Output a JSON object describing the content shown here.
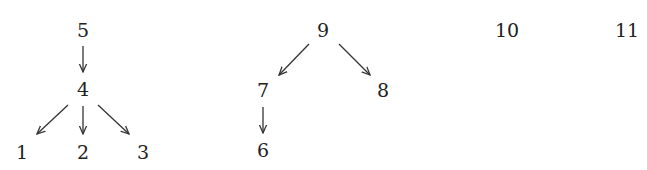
{
  "diagram": {
    "type": "forest",
    "nodes": [
      {
        "id": "5",
        "label": "5",
        "x": 83,
        "y": 30
      },
      {
        "id": "4",
        "label": "4",
        "x": 83,
        "y": 89
      },
      {
        "id": "1",
        "label": "1",
        "x": 22,
        "y": 152
      },
      {
        "id": "2",
        "label": "2",
        "x": 83,
        "y": 152
      },
      {
        "id": "3",
        "label": "3",
        "x": 143,
        "y": 152
      },
      {
        "id": "9",
        "label": "9",
        "x": 323,
        "y": 30
      },
      {
        "id": "7",
        "label": "7",
        "x": 263,
        "y": 90
      },
      {
        "id": "8",
        "label": "8",
        "x": 383,
        "y": 90
      },
      {
        "id": "6",
        "label": "6",
        "x": 263,
        "y": 150
      },
      {
        "id": "10",
        "label": "10",
        "x": 507,
        "y": 30
      },
      {
        "id": "11",
        "label": "11",
        "x": 627,
        "y": 30
      }
    ],
    "edges": [
      {
        "from": "5",
        "to": "4",
        "x1": 83,
        "y1": 46,
        "x2": 83,
        "y2": 72
      },
      {
        "from": "4",
        "to": "1",
        "x1": 68,
        "y1": 105,
        "x2": 37,
        "y2": 134
      },
      {
        "from": "4",
        "to": "2",
        "x1": 83,
        "y1": 106,
        "x2": 83,
        "y2": 134
      },
      {
        "from": "4",
        "to": "3",
        "x1": 98,
        "y1": 105,
        "x2": 129,
        "y2": 134
      },
      {
        "from": "9",
        "to": "7",
        "x1": 309,
        "y1": 44,
        "x2": 279,
        "y2": 75
      },
      {
        "from": "9",
        "to": "8",
        "x1": 339,
        "y1": 44,
        "x2": 370,
        "y2": 75
      },
      {
        "from": "7",
        "to": "6",
        "x1": 263,
        "y1": 107,
        "x2": 263,
        "y2": 133
      }
    ],
    "stroke_color": "#333333",
    "text_color": "#222222"
  }
}
